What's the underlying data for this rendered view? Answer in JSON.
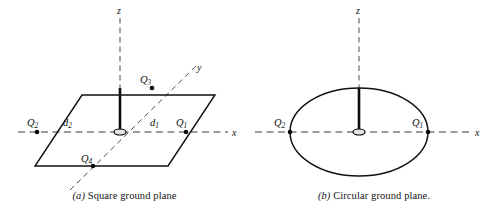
{
  "figure": {
    "panels": [
      {
        "id": "a",
        "caption_index": "(a)",
        "caption_text": "Square ground plane",
        "axes": {
          "x": "x",
          "y": "y",
          "z": "z"
        },
        "charges": [
          {
            "name": "Q",
            "sub": "1",
            "x": 186,
            "y": 132
          },
          {
            "name": "Q",
            "sub": "2",
            "x": 37,
            "y": 132
          },
          {
            "name": "Q",
            "sub": "3",
            "x": 152,
            "y": 88
          },
          {
            "name": "Q",
            "sub": "4",
            "x": 93,
            "y": 166
          }
        ],
        "distances": [
          {
            "name": "d",
            "sub": "1"
          },
          {
            "name": "d",
            "sub": "2"
          }
        ]
      },
      {
        "id": "b",
        "caption_index": "(b)",
        "caption_text": "Circular ground plane.",
        "axes": {
          "x": "x",
          "z": "z"
        },
        "charges": [
          {
            "name": "Q",
            "sub": "1",
            "x": 428,
            "y": 132
          },
          {
            "name": "Q",
            "sub": "2",
            "x": 290,
            "y": 132
          }
        ],
        "distances": []
      }
    ],
    "colors": {
      "outline": "#111111",
      "axis": "#3a3a3a",
      "rod": "#0d0d0d",
      "feed_fill": "#e4e4e4",
      "background": "#ffffff"
    }
  },
  "labels": {
    "panel_a": {
      "z": "z",
      "y": "y",
      "x": "x",
      "q1": "Q",
      "q1_sub": "1",
      "q2": "Q",
      "q2_sub": "2",
      "q3": "Q",
      "q3_sub": "3",
      "q4": "Q",
      "q4_sub": "4",
      "d1": "d",
      "d1_sub": "1",
      "d2": "d",
      "d2_sub": "2"
    },
    "panel_b": {
      "z": "z",
      "x": "x",
      "q1": "Q",
      "q1_sub": "1",
      "q2": "Q",
      "q2_sub": "2"
    }
  },
  "captions": {
    "a_index": "(a)",
    "a_text": " Square ground plane",
    "b_index": "(b)",
    "b_text": " Circular ground plane."
  }
}
